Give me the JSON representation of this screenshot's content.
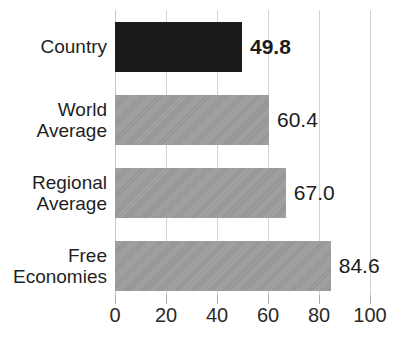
{
  "chart_data": {
    "type": "bar",
    "orientation": "horizontal",
    "title": "",
    "xlabel": "",
    "ylabel": "",
    "categories": [
      "Country",
      "World\nAverage",
      "Regional\nAverage",
      "Free\nEconomies"
    ],
    "values": [
      49.8,
      60.4,
      67.0,
      84.6
    ],
    "value_labels": [
      "49.8",
      "60.4",
      "67.0",
      "84.6"
    ],
    "highlight_index": 0,
    "xlim": [
      0,
      100
    ],
    "xticks": [
      0,
      20,
      40,
      60,
      80,
      100
    ],
    "xtick_labels": [
      "0",
      "20",
      "40",
      "60",
      "80",
      "100"
    ],
    "grid": true,
    "legend": "none",
    "colors": {
      "highlight_bar": "#1b1b1b",
      "bar": "#9b9b9b",
      "gridline": "#d2d2d2",
      "text": "#1c1c1c",
      "background": "#ffffff"
    }
  }
}
